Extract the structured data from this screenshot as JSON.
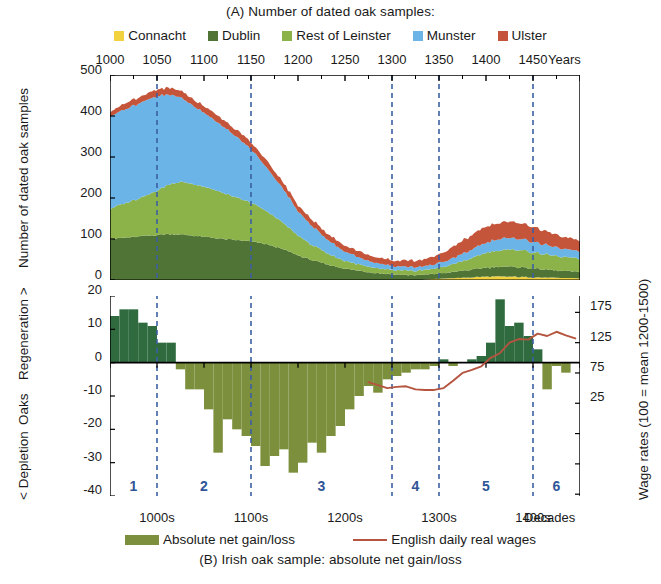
{
  "titles": {
    "top": "(A)  Number of dated oak samples:",
    "bottom": "(B) Irish oak sample: absolute net gain/loss"
  },
  "legend_top": {
    "items": [
      {
        "label": "Connacht",
        "color": "#f2d23f"
      },
      {
        "label": "Dublin",
        "color": "#4f7435"
      },
      {
        "label": "Rest of Leinster",
        "color": "#8cb34a"
      },
      {
        "label": "Munster",
        "color": "#6ab4e8"
      },
      {
        "label": "Ulster",
        "color": "#c4543a"
      }
    ]
  },
  "legend_bottom": {
    "items": [
      {
        "label": "Absolute net gain/loss",
        "color": "#7c8f3c",
        "kind": "swatch"
      },
      {
        "label": "English daily real wages",
        "color": "#b5543f",
        "kind": "line"
      }
    ]
  },
  "axes": {
    "top_x_label": "Years",
    "top_x_ticks": [
      "1000",
      "1050",
      "1100",
      "1150",
      "1200",
      "1250",
      "1300",
      "1350",
      "1400",
      "1450"
    ],
    "top_y_label": "Number of dated oak samples",
    "top_y_ticks": [
      "500",
      "400",
      "300",
      "200",
      "100",
      "0"
    ],
    "bottom_y_label_parts": [
      "< Depletion",
      "Oaks",
      "Regeneration >"
    ],
    "bottom_y_ticks": [
      "20",
      "10",
      "0",
      "-10",
      "-20",
      "-30",
      "-40"
    ],
    "bottom_right_label": "Wage rates (100 = mean 1200-1500)",
    "bottom_right_ticks": [
      "175",
      "125",
      "75",
      "25"
    ],
    "bottom_x_label": "Decades",
    "bottom_x_ticks": [
      "1000s",
      "1100s",
      "1200s",
      "1300s",
      "1400s"
    ]
  },
  "phases": {
    "labels": [
      "1",
      "2",
      "3",
      "4",
      "5",
      "6"
    ],
    "color": "#2f5597",
    "boundaries_year": [
      1050,
      1150,
      1300,
      1350,
      1450
    ]
  },
  "chart_data": [
    {
      "type": "area",
      "title": "(A)  Number of dated oak samples:",
      "xlabel": "Years",
      "ylabel": "Number of dated oak samples",
      "xlim": [
        1000,
        1500
      ],
      "ylim": [
        0,
        500
      ],
      "grid": false,
      "legend_position": "top",
      "stacked": true,
      "x": [
        1000,
        1010,
        1020,
        1030,
        1040,
        1050,
        1060,
        1070,
        1080,
        1090,
        1100,
        1110,
        1120,
        1130,
        1140,
        1150,
        1160,
        1170,
        1180,
        1190,
        1200,
        1210,
        1220,
        1230,
        1240,
        1250,
        1260,
        1270,
        1280,
        1290,
        1300,
        1310,
        1320,
        1330,
        1340,
        1350,
        1360,
        1370,
        1380,
        1390,
        1400,
        1410,
        1420,
        1430,
        1440,
        1450,
        1460,
        1470,
        1480,
        1490,
        1500
      ],
      "series": [
        {
          "name": "Connacht",
          "color": "#f2d23f",
          "values": [
            0,
            0,
            0,
            0,
            0,
            0,
            0,
            0,
            0,
            0,
            0,
            0,
            0,
            0,
            0,
            0,
            0,
            0,
            0,
            0,
            0,
            0,
            0,
            0,
            0,
            0,
            0,
            0,
            0,
            0,
            0,
            0,
            0,
            0,
            2,
            3,
            4,
            5,
            6,
            7,
            8,
            8,
            8,
            8,
            7,
            7,
            6,
            6,
            5,
            5,
            4
          ]
        },
        {
          "name": "Dublin",
          "color": "#4f7435",
          "values": [
            100,
            102,
            104,
            106,
            108,
            110,
            112,
            112,
            110,
            108,
            105,
            103,
            100,
            98,
            96,
            94,
            90,
            85,
            78,
            70,
            60,
            52,
            45,
            38,
            33,
            28,
            24,
            21,
            18,
            16,
            14,
            13,
            12,
            12,
            12,
            13,
            14,
            16,
            18,
            20,
            22,
            23,
            24,
            24,
            23,
            22,
            20,
            18,
            17,
            16,
            15
          ]
        },
        {
          "name": "Rest of Leinster",
          "color": "#8cb34a",
          "values": [
            75,
            80,
            86,
            92,
            100,
            108,
            118,
            126,
            128,
            126,
            122,
            118,
            112,
            106,
            100,
            94,
            86,
            78,
            68,
            58,
            48,
            41,
            34,
            28,
            23,
            19,
            16,
            14,
            12,
            11,
            10,
            10,
            10,
            11,
            12,
            14,
            17,
            21,
            26,
            31,
            36,
            39,
            41,
            42,
            41,
            40,
            38,
            36,
            34,
            33,
            32
          ]
        },
        {
          "name": "Munster",
          "color": "#6ab4e8",
          "values": [
            225,
            228,
            230,
            232,
            232,
            230,
            222,
            212,
            200,
            190,
            180,
            172,
            162,
            152,
            142,
            130,
            116,
            102,
            88,
            74,
            60,
            50,
            42,
            34,
            28,
            23,
            19,
            16,
            13,
            11,
            10,
            9,
            9,
            9,
            10,
            11,
            13,
            16,
            19,
            22,
            25,
            27,
            28,
            28,
            27,
            26,
            24,
            22,
            20,
            18,
            17
          ]
        },
        {
          "name": "Ulster",
          "color": "#c4543a",
          "values": [
            12,
            13,
            14,
            15,
            15,
            16,
            16,
            16,
            16,
            16,
            16,
            17,
            17,
            17,
            17,
            17,
            17,
            17,
            16,
            16,
            15,
            15,
            15,
            15,
            15,
            15,
            15,
            15,
            14,
            14,
            14,
            14,
            15,
            16,
            18,
            21,
            25,
            30,
            34,
            37,
            39,
            40,
            40,
            39,
            38,
            36,
            34,
            32,
            30,
            28,
            27
          ]
        }
      ]
    },
    {
      "type": "bar",
      "title": "(B) Irish oak sample: absolute net gain/loss",
      "xlabel": "Decades",
      "ylabel": "Oaks  < Depletion / Regeneration >",
      "ylim": [
        -40,
        20
      ],
      "y2label": "Wage rates (100 = mean 1200-1500)",
      "y2lim": [
        -128,
        202
      ],
      "grid": false,
      "bar_color_positive": "#2f6b3f",
      "bar_color_negative": "#7c8f3c",
      "decades": [
        1000,
        1010,
        1020,
        1030,
        1040,
        1050,
        1060,
        1070,
        1080,
        1090,
        1100,
        1110,
        1120,
        1130,
        1140,
        1150,
        1160,
        1170,
        1180,
        1190,
        1200,
        1210,
        1220,
        1230,
        1240,
        1250,
        1260,
        1270,
        1280,
        1290,
        1300,
        1310,
        1320,
        1330,
        1340,
        1350,
        1360,
        1370,
        1380,
        1390,
        1400,
        1410,
        1420,
        1430,
        1440,
        1450,
        1460,
        1470,
        1480,
        1490
      ],
      "values": [
        14,
        16,
        16,
        12,
        11,
        6,
        6,
        -2,
        -8,
        -8,
        -14,
        -27,
        -17,
        -20,
        -22,
        -25,
        -31,
        -28,
        -26,
        -33,
        -30,
        -24,
        -27,
        -22,
        -19,
        -14,
        -10,
        -7,
        -9,
        -5,
        -4,
        -3,
        -2,
        -2,
        -1,
        1,
        -1,
        0,
        1,
        2,
        6,
        19,
        11,
        12,
        8,
        4,
        -8,
        -1,
        -3,
        0
      ],
      "wage_series": {
        "name": "English daily real wages",
        "color": "#b5543f",
        "x": [
          1270,
          1280,
          1290,
          1300,
          1310,
          1320,
          1330,
          1340,
          1350,
          1360,
          1370,
          1380,
          1390,
          1400,
          1410,
          1420,
          1430,
          1440,
          1450,
          1460,
          1470,
          1480,
          1490
        ],
        "values": [
          60,
          55,
          50,
          52,
          53,
          48,
          47,
          47,
          50,
          62,
          75,
          80,
          86,
          100,
          108,
          125,
          131,
          130,
          140,
          136,
          143,
          137,
          132
        ]
      }
    }
  ]
}
